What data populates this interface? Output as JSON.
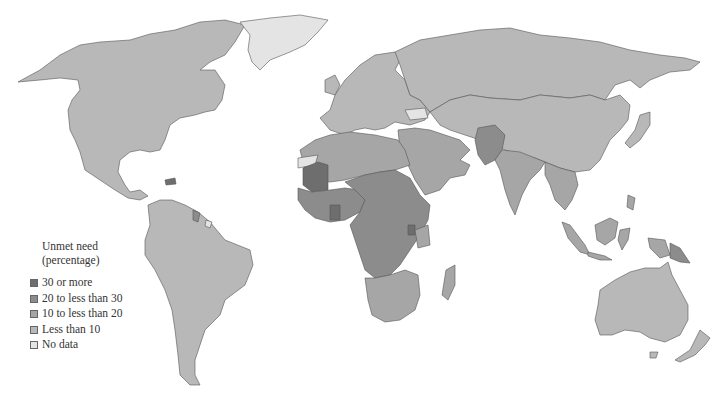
{
  "legend": {
    "title_line1": "Unmet need",
    "title_line2": "(percentage)",
    "items": [
      {
        "label": "30 or more",
        "color": "#6e6e6e"
      },
      {
        "label": "20 to less than 30",
        "color": "#8c8c8c"
      },
      {
        "label": "10 to less than 20",
        "color": "#a6a6a6"
      },
      {
        "label": "Less than 10",
        "color": "#b8b8b8"
      },
      {
        "label": "No data",
        "color": "#e4e4e4"
      }
    ]
  },
  "map": {
    "type": "choropleth-world",
    "colors": {
      "c30": "#6e6e6e",
      "c20": "#8c8c8c",
      "c10": "#a6a6a6",
      "c0": "#b8b8b8",
      "nodata": "#e4e4e4"
    }
  }
}
